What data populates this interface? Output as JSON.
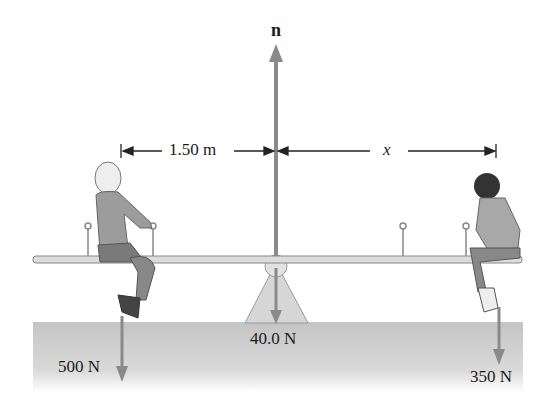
{
  "diagram": {
    "normal_force": {
      "label": "n"
    },
    "distances": {
      "left": "1.50 m",
      "right": "x"
    },
    "forces": {
      "girl_weight": "500 N",
      "seesaw_weight": "40.0 N",
      "boy_weight": "350 N"
    },
    "colors": {
      "arrow": "#8a8a8a",
      "ground": "#cfcfcf",
      "board": "#d8d8d8",
      "fulcrum": "#d4d4d4",
      "text": "#1a1a1a"
    }
  }
}
